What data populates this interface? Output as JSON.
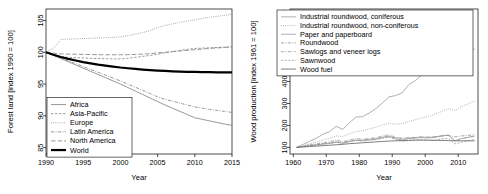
{
  "figure": {
    "title": "",
    "panels": [
      "forest-land-index",
      "wood-production-index"
    ]
  },
  "chart_data": [
    {
      "type": "line",
      "id": "forest-land-index",
      "title": "",
      "xlabel": "Year",
      "ylabel": "Forest land [index 1990 = 100]",
      "xlim": [
        1990,
        2015
      ],
      "ylim": [
        84,
        106.8
      ],
      "xticks": [
        1990,
        1995,
        2000,
        2005,
        2010,
        2015
      ],
      "yticks": [
        85,
        90,
        95,
        100,
        105
      ],
      "grid": false,
      "legend_position": "bottom-left",
      "x": [
        1990,
        1991,
        1992,
        1993,
        1994,
        1995,
        1996,
        1997,
        1998,
        1999,
        2000,
        2001,
        2002,
        2003,
        2004,
        2005,
        2006,
        2007,
        2008,
        2009,
        2010,
        2011,
        2012,
        2013,
        2014,
        2015
      ],
      "series": [
        {
          "name": "Africa",
          "style": "solid",
          "color": "#8c8c8c",
          "width": 0.9,
          "values": [
            100,
            99.5,
            99.0,
            98.5,
            98.0,
            97.5,
            97.0,
            96.5,
            96.0,
            95.5,
            95.0,
            94.45,
            93.9,
            93.35,
            92.8,
            92.25,
            91.7,
            91.2,
            90.7,
            90.2,
            89.7,
            89.45,
            89.2,
            88.95,
            88.7,
            88.5
          ]
        },
        {
          "name": "Asia-Pacific",
          "style": "dashed",
          "color": "#8c8c8c",
          "width": 0.9,
          "values": [
            100,
            99.6,
            99.3,
            99.2,
            99.15,
            99.1,
            99.05,
            99.0,
            98.98,
            98.96,
            98.95,
            99.05,
            99.2,
            99.35,
            99.5,
            99.7,
            99.9,
            100.1,
            100.3,
            100.45,
            100.6,
            100.65,
            100.7,
            100.75,
            100.8,
            100.85
          ]
        },
        {
          "name": "Europe",
          "style": "dotted",
          "color": "#8c8c8c",
          "width": 0.9,
          "values": [
            100,
            100.6,
            102.0,
            102.05,
            102.1,
            102.15,
            102.2,
            102.25,
            102.3,
            102.35,
            102.4,
            102.6,
            102.85,
            103.1,
            103.4,
            103.9,
            104.2,
            104.45,
            104.7,
            104.9,
            105.1,
            105.3,
            105.5,
            105.65,
            105.8,
            106.0
          ]
        },
        {
          "name": "Latin America",
          "style": "dashdot",
          "color": "#8c8c8c",
          "width": 0.9,
          "values": [
            100,
            99.55,
            99.1,
            98.65,
            98.2,
            97.75,
            97.3,
            96.85,
            96.4,
            95.95,
            95.5,
            95.0,
            94.5,
            94.0,
            93.5,
            93.0,
            92.6,
            92.3,
            92.0,
            91.7,
            91.4,
            91.2,
            91.0,
            90.85,
            90.7,
            90.55
          ]
        },
        {
          "name": "North America",
          "style": "longdash",
          "color": "#8c8c8c",
          "width": 0.9,
          "values": [
            100,
            99.85,
            99.75,
            99.7,
            99.68,
            99.66,
            99.64,
            99.62,
            99.6,
            99.6,
            99.6,
            99.62,
            99.65,
            99.7,
            99.78,
            99.9,
            100.0,
            100.1,
            100.2,
            100.3,
            100.4,
            100.5,
            100.6,
            100.68,
            100.75,
            100.85
          ]
        },
        {
          "name": "World",
          "style": "solid",
          "color": "#000000",
          "width": 2.2,
          "values": [
            100,
            99.6,
            99.25,
            98.95,
            98.7,
            98.45,
            98.25,
            98.05,
            97.9,
            97.75,
            97.6,
            97.48,
            97.38,
            97.28,
            97.2,
            97.12,
            97.06,
            97.0,
            96.96,
            96.92,
            96.9,
            96.88,
            96.86,
            96.85,
            96.84,
            96.83
          ]
        }
      ]
    },
    {
      "type": "line",
      "id": "wood-production-index",
      "title": "",
      "xlabel": "Year",
      "ylabel": "Wood production [index 1961 = 100]",
      "xlim": [
        1959,
        2016
      ],
      "ylim": [
        70,
        730
      ],
      "xticks": [
        1960,
        1970,
        1980,
        1990,
        2000,
        2010
      ],
      "yticks": [
        100,
        200,
        300,
        400,
        500,
        600,
        700
      ],
      "grid": false,
      "legend_position": "top",
      "x": [
        1961,
        1963,
        1965,
        1967,
        1969,
        1971,
        1973,
        1975,
        1977,
        1979,
        1981,
        1983,
        1985,
        1987,
        1989,
        1991,
        1993,
        1995,
        1997,
        1999,
        2001,
        2003,
        2005,
        2007,
        2009,
        2011,
        2013,
        2015
      ],
      "series": [
        {
          "name": "Industrial roundwood, coniferous",
          "style": "solid",
          "color": "#9a9a9a",
          "width": 0.8,
          "values": [
            100,
            104,
            108,
            110,
            115,
            118,
            124,
            118,
            126,
            133,
            130,
            134,
            138,
            146,
            152,
            140,
            134,
            140,
            142,
            145,
            143,
            146,
            152,
            156,
            130,
            140,
            146,
            152
          ]
        },
        {
          "name": "Industrial roundwood, non-coniferous",
          "style": "dotted",
          "color": "#9a9a9a",
          "width": 0.9,
          "values": [
            100,
            108,
            116,
            124,
            133,
            142,
            152,
            150,
            162,
            172,
            176,
            184,
            192,
            202,
            210,
            206,
            208,
            218,
            226,
            234,
            240,
            252,
            264,
            276,
            268,
            286,
            298,
            312
          ]
        },
        {
          "name": "Paper and paperboard",
          "style": "solid",
          "color": "#b0b0b0",
          "width": 1.0,
          "values": [
            100,
            114,
            128,
            142,
            160,
            172,
            196,
            182,
            212,
            238,
            240,
            256,
            276,
            302,
            330,
            336,
            348,
            386,
            404,
            430,
            438,
            468,
            498,
            540,
            508,
            536,
            540,
            548
          ]
        },
        {
          "name": "Roundwood",
          "style": "dashdot",
          "color": "#8c8c8c",
          "width": 0.8,
          "values": [
            100,
            104,
            108,
            112,
            116,
            119,
            123,
            124,
            128,
            132,
            134,
            137,
            140,
            144,
            148,
            145,
            142,
            144,
            145,
            147,
            147,
            149,
            152,
            155,
            148,
            152,
            155,
            158
          ]
        },
        {
          "name": "Sawlogs and veneer logs",
          "style": "dashdot",
          "color": "#9a9a9a",
          "width": 0.8,
          "values": [
            100,
            106,
            112,
            116,
            122,
            126,
            133,
            126,
            134,
            141,
            137,
            141,
            144,
            152,
            158,
            146,
            139,
            144,
            146,
            148,
            145,
            148,
            153,
            156,
            130,
            140,
            146,
            151
          ]
        },
        {
          "name": "Sawnwood",
          "style": "dashed",
          "color": "#9a9a9a",
          "width": 0.8,
          "values": [
            100,
            105,
            110,
            113,
            118,
            121,
            128,
            120,
            128,
            134,
            129,
            133,
            135,
            142,
            147,
            136,
            128,
            132,
            133,
            136,
            132,
            134,
            139,
            142,
            116,
            124,
            130,
            136
          ]
        },
        {
          "name": "Wood fuel",
          "style": "solid",
          "color": "#6f6f6f",
          "width": 0.9,
          "values": [
            100,
            102,
            104,
            106,
            108,
            110,
            112,
            114,
            117,
            119,
            121,
            123,
            125,
            127,
            129,
            130,
            131,
            132,
            133,
            133,
            133,
            132,
            132,
            131,
            130,
            130,
            130,
            130
          ]
        }
      ]
    }
  ]
}
